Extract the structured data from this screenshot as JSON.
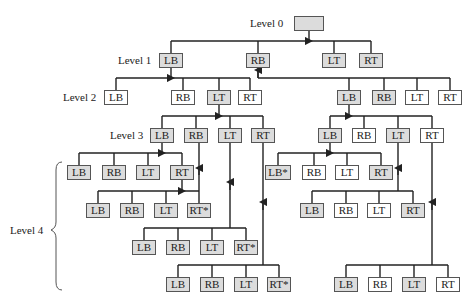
{
  "levels": {
    "l0": "Level 0",
    "l1": "Level 1",
    "l2": "Level 2",
    "l3": "Level 3",
    "l4": "Level 4"
  },
  "nodes": [
    {
      "id": "root",
      "text": "",
      "x": 294,
      "y": 16,
      "w": 30,
      "shaded": true
    },
    {
      "id": "L1-LB",
      "text": "LB",
      "x": 159,
      "y": 53,
      "w": 24,
      "shaded": true
    },
    {
      "id": "L1-RB",
      "text": "RB",
      "x": 246,
      "y": 53,
      "w": 24,
      "shaded": true
    },
    {
      "id": "L1-LT",
      "text": "LT",
      "x": 322,
      "y": 53,
      "w": 24,
      "shaded": true
    },
    {
      "id": "L1-RT",
      "text": "RT",
      "x": 359,
      "y": 53,
      "w": 24,
      "shaded": true
    },
    {
      "id": "L2a-LB",
      "text": "LB",
      "x": 104,
      "y": 90,
      "w": 24,
      "shaded": false
    },
    {
      "id": "L2a-RB",
      "text": "RB",
      "x": 171,
      "y": 90,
      "w": 24,
      "shaded": false
    },
    {
      "id": "L2a-LT",
      "text": "LT",
      "x": 207,
      "y": 90,
      "w": 24,
      "shaded": true
    },
    {
      "id": "L2a-RT",
      "text": "RT",
      "x": 238,
      "y": 90,
      "w": 24,
      "shaded": false
    },
    {
      "id": "L2b-LB",
      "text": "LB",
      "x": 337,
      "y": 90,
      "w": 24,
      "shaded": true
    },
    {
      "id": "L2b-RB",
      "text": "RB",
      "x": 372,
      "y": 90,
      "w": 24,
      "shaded": true
    },
    {
      "id": "L2b-LT",
      "text": "LT",
      "x": 405,
      "y": 90,
      "w": 24,
      "shaded": false
    },
    {
      "id": "L2b-RT",
      "text": "RT",
      "x": 438,
      "y": 90,
      "w": 24,
      "shaded": false
    },
    {
      "id": "L3a-LB",
      "text": "LB",
      "x": 150,
      "y": 128,
      "w": 24,
      "shaded": true
    },
    {
      "id": "L3a-RB",
      "text": "RB",
      "x": 184,
      "y": 128,
      "w": 24,
      "shaded": true
    },
    {
      "id": "L3a-LT",
      "text": "LT",
      "x": 218,
      "y": 128,
      "w": 24,
      "shaded": true
    },
    {
      "id": "L3a-RT",
      "text": "RT",
      "x": 251,
      "y": 128,
      "w": 24,
      "shaded": true
    },
    {
      "id": "L3b-LB",
      "text": "LB",
      "x": 318,
      "y": 128,
      "w": 24,
      "shaded": true
    },
    {
      "id": "L3b-RB",
      "text": "RB",
      "x": 352,
      "y": 128,
      "w": 24,
      "shaded": false
    },
    {
      "id": "L3b-LT",
      "text": "LT",
      "x": 386,
      "y": 128,
      "w": 24,
      "shaded": true
    },
    {
      "id": "L3b-RT",
      "text": "RT",
      "x": 420,
      "y": 128,
      "w": 24,
      "shaded": false
    },
    {
      "id": "A-LB",
      "text": "LB",
      "x": 67,
      "y": 165,
      "w": 24,
      "shaded": true
    },
    {
      "id": "A-RB",
      "text": "RB",
      "x": 102,
      "y": 165,
      "w": 24,
      "shaded": true
    },
    {
      "id": "A-LT",
      "text": "LT",
      "x": 136,
      "y": 165,
      "w": 24,
      "shaded": true
    },
    {
      "id": "A-RT",
      "text": "RT",
      "x": 170,
      "y": 165,
      "w": 24,
      "shaded": true
    },
    {
      "id": "B-LB",
      "text": "LB",
      "x": 86,
      "y": 203,
      "w": 24,
      "shaded": true
    },
    {
      "id": "B-RB",
      "text": "RB",
      "x": 120,
      "y": 203,
      "w": 24,
      "shaded": true
    },
    {
      "id": "B-LT",
      "text": "LT",
      "x": 154,
      "y": 203,
      "w": 24,
      "shaded": true
    },
    {
      "id": "B-RT",
      "text": "RT*",
      "x": 187,
      "y": 203,
      "w": 24,
      "shaded": true
    },
    {
      "id": "C-LB",
      "text": "LB",
      "x": 132,
      "y": 240,
      "w": 24,
      "shaded": true
    },
    {
      "id": "C-RB",
      "text": "RB",
      "x": 166,
      "y": 240,
      "w": 24,
      "shaded": true
    },
    {
      "id": "C-LT",
      "text": "LT",
      "x": 200,
      "y": 240,
      "w": 24,
      "shaded": true
    },
    {
      "id": "C-RT",
      "text": "RT*",
      "x": 234,
      "y": 240,
      "w": 24,
      "shaded": true
    },
    {
      "id": "D-LB",
      "text": "LB",
      "x": 166,
      "y": 277,
      "w": 24,
      "shaded": true
    },
    {
      "id": "D-RB",
      "text": "RB",
      "x": 200,
      "y": 277,
      "w": 24,
      "shaded": true
    },
    {
      "id": "D-LT",
      "text": "LT",
      "x": 234,
      "y": 277,
      "w": 24,
      "shaded": true
    },
    {
      "id": "D-RT",
      "text": "RT*",
      "x": 267,
      "y": 277,
      "w": 24,
      "shaded": true
    },
    {
      "id": "E-LB",
      "text": "LB*",
      "x": 265,
      "y": 165,
      "w": 26,
      "shaded": true
    },
    {
      "id": "E-RB",
      "text": "RB",
      "x": 302,
      "y": 165,
      "w": 24,
      "shaded": false
    },
    {
      "id": "E-LT",
      "text": "LT",
      "x": 335,
      "y": 165,
      "w": 24,
      "shaded": false
    },
    {
      "id": "E-RT",
      "text": "RT",
      "x": 369,
      "y": 165,
      "w": 24,
      "shaded": true
    },
    {
      "id": "F-LB",
      "text": "LB",
      "x": 300,
      "y": 203,
      "w": 24,
      "shaded": true
    },
    {
      "id": "F-RB",
      "text": "RB",
      "x": 334,
      "y": 203,
      "w": 24,
      "shaded": false
    },
    {
      "id": "F-LT",
      "text": "LT",
      "x": 367,
      "y": 203,
      "w": 24,
      "shaded": false
    },
    {
      "id": "F-RT",
      "text": "RT",
      "x": 401,
      "y": 203,
      "w": 24,
      "shaded": true
    },
    {
      "id": "G-LB",
      "text": "LB",
      "x": 334,
      "y": 277,
      "w": 24,
      "shaded": true
    },
    {
      "id": "G-RB",
      "text": "RB",
      "x": 368,
      "y": 277,
      "w": 24,
      "shaded": false
    },
    {
      "id": "G-LT",
      "text": "LT",
      "x": 402,
      "y": 277,
      "w": 24,
      "shaded": true
    },
    {
      "id": "G-RT",
      "text": "RT",
      "x": 436,
      "y": 277,
      "w": 24,
      "shaded": false
    }
  ]
}
